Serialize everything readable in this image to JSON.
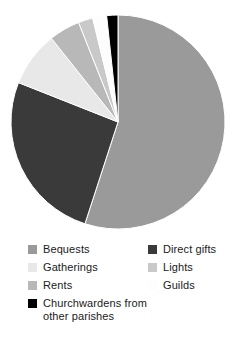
{
  "chart_data": {
    "type": "pie",
    "title": "",
    "subtitle": "",
    "xlabel": "",
    "ylabel": "",
    "legend_position": "bottom",
    "grid": false,
    "start_angle_deg": 0,
    "direction": "clockwise",
    "categories": [
      "Bequests",
      "Direct gifts",
      "Gatherings",
      "Rents",
      "Lights",
      "Guilds",
      "Churchwardens from other parishes"
    ],
    "values": [
      55.0,
      26.0,
      8.3,
      4.7,
      2.2,
      2.1,
      1.7
    ],
    "units": "percent",
    "slices": [
      {
        "label": "Bequests",
        "value": 55.0,
        "color": "#9a9a9a",
        "start_deg": 0.0,
        "end_deg": 198.0
      },
      {
        "label": "Direct gifts",
        "value": 26.0,
        "color": "#3a3a3a",
        "start_deg": 198.0,
        "end_deg": 291.6
      },
      {
        "label": "Gatherings",
        "value": 8.3,
        "color": "#e8e8e8",
        "start_deg": 291.6,
        "end_deg": 321.5
      },
      {
        "label": "Rents",
        "value": 4.7,
        "color": "#b8b8b8",
        "start_deg": 321.5,
        "end_deg": 338.4
      },
      {
        "label": "Lights",
        "value": 2.2,
        "color": "#c9c9c9",
        "start_deg": 338.4,
        "end_deg": 346.3
      },
      {
        "label": "Guilds",
        "value": 2.1,
        "color": "#fdfdfd",
        "start_deg": 346.3,
        "end_deg": 353.9
      },
      {
        "label": "Churchwardens from other parishes",
        "value": 1.7,
        "color": "#000000",
        "start_deg": 353.9,
        "end_deg": 360.0
      }
    ]
  },
  "legend": {
    "left_column": [
      {
        "label": "Bequests",
        "color": "#9a9a9a"
      },
      {
        "label": "Gatherings",
        "color": "#e8e8e8"
      },
      {
        "label": "Rents",
        "color": "#b8b8b8"
      },
      {
        "label": "Churchwardens from\nother parishes",
        "color": "#000000"
      }
    ],
    "right_column": [
      {
        "label": "Direct gifts",
        "color": "#3a3a3a"
      },
      {
        "label": "Lights",
        "color": "#c9c9c9"
      },
      {
        "label": "Guilds",
        "color": "#fdfdfd"
      }
    ]
  },
  "geometry": {
    "center_x": 118,
    "center_y": 122,
    "radius": 107
  }
}
